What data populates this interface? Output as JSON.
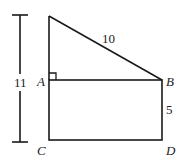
{
  "diagram": {
    "type": "geometry-figure",
    "stroke_color": "#1a1a1a",
    "points": {
      "A": "A",
      "B": "B",
      "C": "C",
      "D": "D"
    },
    "measurements": {
      "hypotenuse": "10",
      "side_BD": "5",
      "total_height": "11"
    },
    "right_angle_at": "A"
  }
}
